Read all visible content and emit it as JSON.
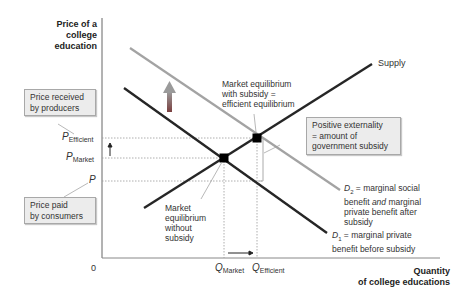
{
  "axes": {
    "y_label_line1": "Price of a",
    "y_label_line2": "college",
    "y_label_line3": "education",
    "x_label_line1": "Quantity",
    "x_label_line2": "of college educations",
    "origin": "0"
  },
  "price_ticks": {
    "efficient_sym": "P",
    "efficient_sub": "Efficient",
    "market_sym": "P",
    "market_sub": "Market",
    "paid_sym": "P"
  },
  "quantity_ticks": {
    "market_sym": "Q",
    "market_sub": "Market",
    "efficient_sym": "Q",
    "efficient_sub": "Efficient"
  },
  "callouts": {
    "producers_line1": "Price received",
    "producers_line2": "by producers",
    "consumers_line1": "Price paid",
    "consumers_line2": "by consumers",
    "externality_line1": "Positive externality",
    "externality_line2": "= amount of",
    "externality_line3": "government subsidy"
  },
  "annotations": {
    "efficient_eq_line1": "Market equilibrium",
    "efficient_eq_line2": "with subsidy =",
    "efficient_eq_line3": "efficient equilibrium",
    "market_eq_line1": "Market",
    "market_eq_line2": "equilibrium",
    "market_eq_line3": "without",
    "market_eq_line4": "subsidy"
  },
  "curves": {
    "supply": "Supply",
    "d2_sym": "D",
    "d2_sub": "2",
    "d2_line1": " = marginal social",
    "d2_line2a": "benefit ",
    "d2_line2b": "and",
    "d2_line2c": " marginal",
    "d2_line3": "private benefit after",
    "d2_line4": "subsidy",
    "d1_sym": "D",
    "d1_sub": "1",
    "d1_line1": " = marginal private",
    "d1_line2": "benefit before subsidy"
  },
  "colors": {
    "axis": "#555555",
    "supply": "#222222",
    "d1": "#222222",
    "d2": "#a0a0a0",
    "arrow_top": "#9a9a9a",
    "arrow_bottom": "#7a3a3a",
    "box_fill": "#ececec"
  }
}
